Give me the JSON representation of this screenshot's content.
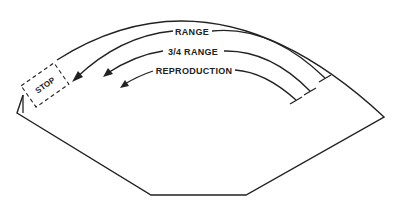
{
  "diagram": {
    "labels": {
      "range": "RANGE",
      "three_quarter_range": "3/4 RANGE",
      "reproduction": "REPRODUCTION",
      "stop": "STOP"
    },
    "colors": {
      "line": "#222222",
      "background": "#ffffff"
    }
  }
}
